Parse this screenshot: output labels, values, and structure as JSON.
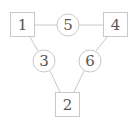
{
  "diagram": {
    "nodes": [
      {
        "id": "1",
        "label": "1",
        "shape": "square"
      },
      {
        "id": "2",
        "label": "2",
        "shape": "square"
      },
      {
        "id": "3",
        "label": "3",
        "shape": "circle"
      },
      {
        "id": "4",
        "label": "4",
        "shape": "square"
      },
      {
        "id": "5",
        "label": "5",
        "shape": "circle"
      },
      {
        "id": "6",
        "label": "6",
        "shape": "circle"
      }
    ],
    "edges": [
      [
        "1",
        "5"
      ],
      [
        "5",
        "4"
      ],
      [
        "1",
        "3"
      ],
      [
        "3",
        "2"
      ],
      [
        "4",
        "6"
      ],
      [
        "6",
        "2"
      ]
    ],
    "colors": {
      "stroke": "#c8c8c8",
      "text": "#555555"
    }
  }
}
